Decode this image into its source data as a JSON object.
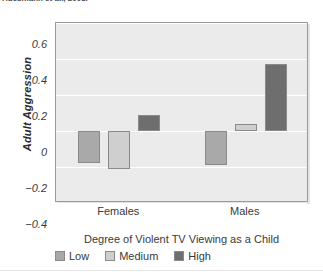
{
  "header": {
    "citation": "Huesmann et al., 2003."
  },
  "chart_data": {
    "type": "bar",
    "title": "",
    "xlabel": "Degree of Violent TV Viewing as a Child",
    "ylabel": "Adult Aggression",
    "categories": [
      "Females",
      "Males"
    ],
    "series": [
      {
        "name": "Low",
        "values": [
          -0.18,
          -0.19
        ],
        "color": "#a9a9a9"
      },
      {
        "name": "Medium",
        "values": [
          -0.21,
          0.04
        ],
        "color": "#cfcfcf"
      },
      {
        "name": "High",
        "values": [
          0.09,
          0.37
        ],
        "color": "#6e6e6e"
      }
    ],
    "ylim": [
      -0.4,
      0.6
    ],
    "yticks": [
      0.6,
      0.4,
      0.2,
      0,
      -0.2,
      -0.4
    ],
    "ytick_labels": [
      "0.6",
      "0.4",
      "0.2",
      "0",
      "−0.2",
      "−0.4"
    ],
    "grid": true,
    "grid_color": "#ffffff",
    "plot_bg": "#ebebeb",
    "legend_position": "bottom",
    "legend_entries": [
      "Low",
      "Medium",
      "High"
    ]
  }
}
